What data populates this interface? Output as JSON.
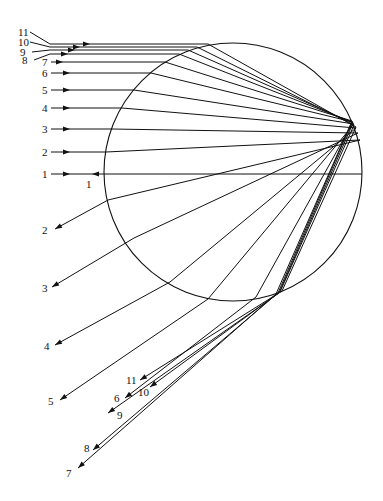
{
  "diagram": {
    "colors": {
      "stroke": "#111111",
      "background": "#ffffff"
    },
    "drop": {
      "cx": 233,
      "cy": 172,
      "r": 129
    },
    "incoming_rays": [
      {
        "label": "1",
        "y": 174,
        "entry": [
          105,
          174
        ],
        "reflect": [
          362,
          174
        ],
        "label_pos": [
          42,
          178
        ],
        "arrow_x": 70
      },
      {
        "label": "2",
        "y": 152,
        "entry": [
          106,
          152
        ],
        "reflect": [
          360,
          140
        ],
        "label_pos": [
          42,
          156
        ],
        "arrow_x": 70
      },
      {
        "label": "3",
        "y": 129,
        "entry": [
          112,
          129
        ],
        "reflect": [
          358,
          133
        ],
        "label_pos": [
          42,
          133
        ],
        "arrow_x": 70
      },
      {
        "label": "4",
        "y": 108,
        "entry": [
          122,
          108
        ],
        "reflect": [
          356,
          128
        ],
        "label_pos": [
          42,
          112
        ],
        "arrow_x": 70
      },
      {
        "label": "5",
        "y": 90,
        "entry": [
          134,
          90
        ],
        "reflect": [
          354,
          124
        ],
        "label_pos": [
          42,
          94
        ],
        "arrow_x": 70
      },
      {
        "label": "6",
        "y": 73,
        "entry": [
          151,
          73
        ],
        "reflect": [
          353,
          122
        ],
        "label_pos": [
          42,
          77
        ],
        "arrow_x": 70
      },
      {
        "label": "7",
        "y": 62,
        "entry": [
          165,
          62
        ],
        "reflect": [
          352,
          121
        ],
        "label_pos": [
          42,
          66
        ],
        "arrow_x": 63
      },
      {
        "label": "8",
        "y": 54,
        "entry": [
          179,
          54
        ],
        "reflect": [
          352,
          122
        ],
        "label_pos": [
          22,
          64
        ],
        "arrow_x": 68
      },
      {
        "label": "9",
        "y": 50,
        "entry": [
          188,
          50
        ],
        "reflect": [
          353,
          123
        ],
        "label_pos": [
          20,
          56
        ],
        "arrow_x": 75
      },
      {
        "label": "10",
        "y": 47,
        "entry": [
          197,
          47
        ],
        "reflect": [
          354,
          125
        ],
        "label_pos": [
          18,
          46
        ],
        "arrow_x": 80
      },
      {
        "label": "11",
        "y": 44,
        "entry": [
          208,
          44
        ],
        "reflect": [
          356,
          127
        ],
        "label_pos": [
          18,
          36
        ],
        "arrow_x": 90
      }
    ],
    "outgoing_rays": [
      {
        "label": "1",
        "exit": [
          105,
          174
        ],
        "end": [
          92,
          174
        ],
        "label_pos": [
          86,
          188
        ]
      },
      {
        "label": "2",
        "exit": [
          108,
          200
        ],
        "end": [
          55,
          229
        ],
        "label_pos": [
          42,
          234
        ]
      },
      {
        "label": "3",
        "exit": [
          134,
          238
        ],
        "end": [
          52,
          287
        ],
        "label_pos": [
          42,
          292
        ]
      },
      {
        "label": "4",
        "exit": [
          170,
          282
        ],
        "end": [
          55,
          345
        ],
        "label_pos": [
          44,
          350
        ]
      },
      {
        "label": "5",
        "exit": [
          208,
          299
        ],
        "end": [
          60,
          400
        ],
        "label_pos": [
          48,
          405
        ]
      },
      {
        "label": "6",
        "exit": [
          256,
          297
        ],
        "end": [
          125,
          398
        ],
        "label_pos": [
          114,
          402
        ]
      },
      {
        "label": "7",
        "exit": [
          276,
          294
        ],
        "end": [
          78,
          468
        ],
        "label_pos": [
          66,
          477
        ]
      },
      {
        "label": "8",
        "exit": [
          278,
          293
        ],
        "end": [
          93,
          450
        ],
        "label_pos": [
          84,
          452
        ]
      },
      {
        "label": "9",
        "exit": [
          279,
          293
        ],
        "end": [
          108,
          413
        ],
        "label_pos": [
          117,
          419
        ]
      },
      {
        "label": "10",
        "exit": [
          280,
          292
        ],
        "end": [
          150,
          387
        ],
        "label_pos": [
          138,
          396
        ]
      },
      {
        "label": "11",
        "exit": [
          282,
          291
        ],
        "end": [
          140,
          380
        ],
        "label_pos": [
          126,
          384
        ]
      }
    ]
  }
}
